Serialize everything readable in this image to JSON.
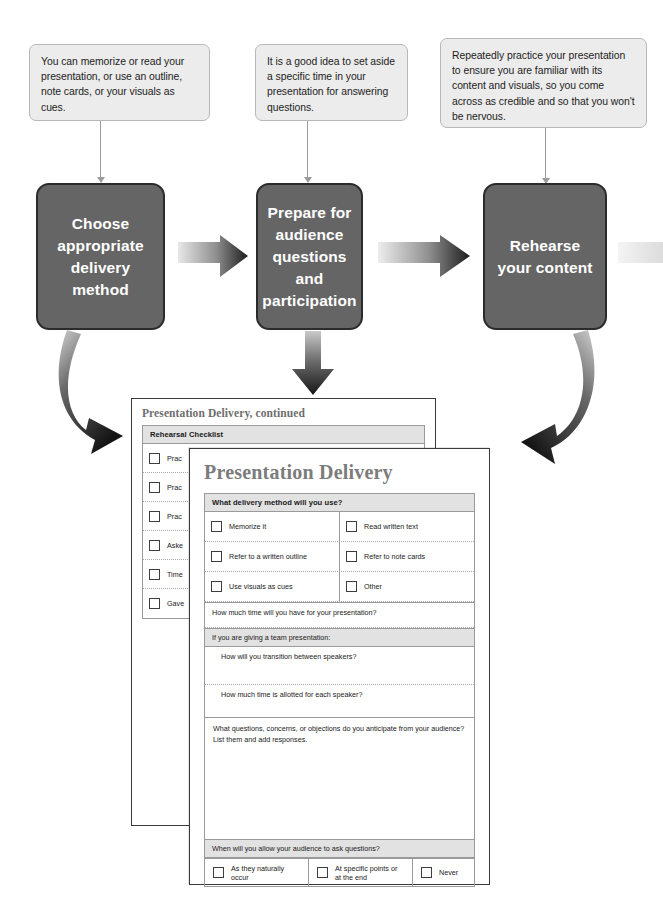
{
  "diagram": {
    "callouts": [
      {
        "id": "callout-delivery-method",
        "text": "You can memorize or read your presentation, or use an outline, note cards, or your visuals as cues."
      },
      {
        "id": "callout-audience-questions",
        "text": "It is a good idea to set aside a specific time in your presentation for answering questions."
      },
      {
        "id": "callout-rehearse",
        "text": "Repeatedly practice your presentation to ensure you are familiar with its content and visuals, so you come across as credible and so that you won't be nervous."
      }
    ],
    "steps": [
      {
        "id": "step-choose-delivery-method",
        "label": "Choose appropriate delivery method"
      },
      {
        "id": "step-prepare-audience-questions",
        "label": "Prepare for audience questions and participation"
      },
      {
        "id": "step-rehearse-content",
        "label": "Rehearse your content"
      }
    ],
    "colors": {
      "step_fill": "#656565",
      "step_border": "#2b2b2b",
      "callout_fill": "#ececec",
      "callout_border": "#b8b8b8",
      "arrow_dark": "#222222",
      "arrow_light": "#d8d8d8",
      "band_fill": "#e2e2e2",
      "title_gray": "#7c7c7c"
    }
  },
  "back_document": {
    "title": "Presentation Delivery, continued",
    "section_header": "Rehearsal Checklist",
    "items": [
      {
        "label": "Prac"
      },
      {
        "label": "Prac"
      },
      {
        "label": "Prac"
      },
      {
        "label": "Aske"
      },
      {
        "label": "Time"
      },
      {
        "label": "Gave"
      }
    ]
  },
  "front_document": {
    "title": "Presentation Delivery",
    "delivery_method": {
      "header": "What delivery method will you use?",
      "options": [
        [
          "Memorize it",
          "Read written text"
        ],
        [
          "Refer to a written outline",
          "Refer to note cards"
        ],
        [
          "Use visuals as cues",
          "Other"
        ]
      ]
    },
    "time_question": "How much time will you have for your presentation?",
    "team_header": "If you are giving a team presentation:",
    "team_questions": [
      "How will you transition between speakers?",
      "How much time is allotted for each speaker?"
    ],
    "anticipate_prompt": "What questions, concerns, or objections do you anticipate from your audience? List them and add responses.",
    "when_header": "When will you allow your audience to ask questions?",
    "when_options": [
      "As they naturally occur",
      "At specific points or at the end",
      "Never"
    ]
  }
}
